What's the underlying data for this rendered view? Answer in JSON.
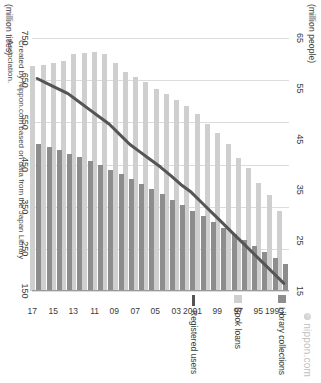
{
  "watermark": {
    "text": "nippon.com",
    "icon": "nippon-dot-icon"
  },
  "credit": "Created by Nippon.com based on data from the Japan Library Association.",
  "axes": {
    "people_unit": "(million people)",
    "titles_unit": "(million titles)",
    "people_ticks": [
      "65",
      "55",
      "45",
      "35",
      "25",
      "15"
    ],
    "titles_ticks": [
      "750",
      "650",
      "550",
      "450",
      "350",
      "250",
      "150"
    ]
  },
  "legend": [
    {
      "label": "Library collections",
      "swatch": "dark-square-icon",
      "color": "#8d8d8d"
    },
    {
      "label": "Book loans",
      "swatch": "light-square-icon",
      "color": "#cfcfcf"
    },
    {
      "label": "Registered users",
      "swatch": "line-icon",
      "color": "#555555"
    }
  ],
  "chart_data": {
    "type": "bar",
    "title": "",
    "subtitle": "",
    "xlabel": "",
    "ylabel": "",
    "orientation": "horizontal",
    "grid": true,
    "legend_position": "right",
    "categories": [
      "1993",
      "94",
      "95",
      "96",
      "97",
      "98",
      "99",
      "2000",
      "2001",
      "02",
      "03",
      "04",
      "05",
      "06",
      "07",
      "08",
      "09",
      "10",
      "11",
      "12",
      "13",
      "14",
      "15",
      "16",
      "17"
    ],
    "tick_categories": [
      "1993",
      "95",
      "97",
      "99",
      "2001",
      "03",
      "05",
      "07",
      "09",
      "11",
      "13",
      "15",
      "17"
    ],
    "axis_bottom": {
      "name": "Library collections / Book loans",
      "unit": "million titles",
      "ticks": [
        150,
        250,
        350,
        450,
        550,
        650,
        750
      ],
      "min": 150,
      "max": 750
    },
    "axis_top": {
      "name": "Registered users",
      "unit": "million people",
      "ticks": [
        15,
        25,
        35,
        45,
        55,
        65
      ],
      "min": 15,
      "max": 65
    },
    "series": [
      {
        "name": "Library collections",
        "unit": "million titles",
        "axis": "bottom",
        "type": "bar",
        "color": "#8d8d8d",
        "values": [
          215,
          228,
          242,
          256,
          271,
          286,
          300,
          314,
          327,
          340,
          353,
          366,
          379,
          392,
          404,
          416,
          428,
          438,
          449,
          459,
          468,
          476,
          484,
          491,
          498
        ]
      },
      {
        "name": "Book loans",
        "unit": "million titles",
        "axis": "bottom",
        "type": "bar",
        "color": "#cfcfcf",
        "values": [
          340,
          378,
          406,
          441,
          465,
          498,
          525,
          547,
          569,
          588,
          603,
          618,
          630,
          646,
          657,
          670,
          691,
          711,
          716,
          714,
          711,
          695,
          690,
          685,
          684
        ]
      },
      {
        "name": "Registered users",
        "unit": "million people",
        "axis": "top",
        "type": "line",
        "color": "#555555",
        "values": [
          16.5,
          18.5,
          20.5,
          22.5,
          24.5,
          26.5,
          28.5,
          30.5,
          32.5,
          34.5,
          36.0,
          37.8,
          39.5,
          41.0,
          42.5,
          44.0,
          46.0,
          48.0,
          49.5,
          51.0,
          52.5,
          54.0,
          55.0,
          56.0,
          57.0
        ]
      }
    ]
  }
}
